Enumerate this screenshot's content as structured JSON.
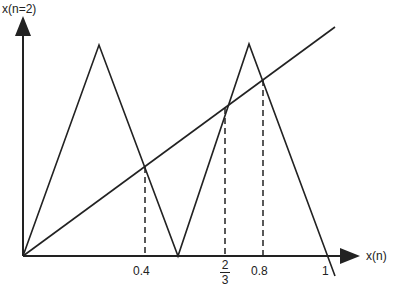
{
  "diagram": {
    "y_axis_label": "x(n=2)",
    "x_axis_label": "x(n)",
    "ticks": [
      {
        "label": "0.4",
        "value": 0.4
      },
      {
        "label_num": "2",
        "label_den": "3",
        "value": 0.6667
      },
      {
        "label": "0.8",
        "value": 0.8
      },
      {
        "label": "1",
        "value": 1
      }
    ],
    "curves": {
      "second_iterate": "piecewise-linear double tent: 0 → peak at 0.25 → 0 at 0.5 → peak at 0.75 → 0 at 1",
      "identity_line": "x(n+2) = x(n)"
    },
    "fixed_points_marked": [
      0.4,
      0.6667,
      0.8
    ],
    "line_color": "#222222",
    "background": "#ffffff"
  }
}
